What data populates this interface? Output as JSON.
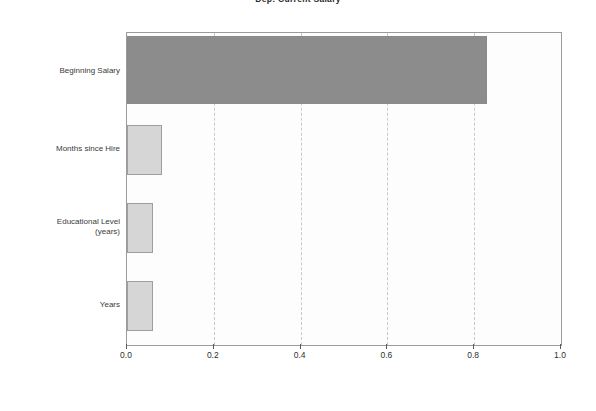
{
  "chart_data": {
    "type": "bar",
    "orientation": "horizontal",
    "title": "Dep: Current Salary",
    "xlabel": "",
    "ylabel": "",
    "categories": [
      "Beginning Salary",
      "Months since Hire",
      "Educational Level\n(years)",
      "Years"
    ],
    "values": [
      0.83,
      0.08,
      0.06,
      0.06
    ],
    "xlim": [
      0.0,
      1.0
    ],
    "xticks": [
      0.0,
      0.2,
      0.4,
      0.6,
      0.8,
      1.0
    ],
    "xtick_labels": [
      "0.0",
      "0.2",
      "0.4",
      "0.6",
      "0.8",
      "1.0"
    ],
    "grid": "vertical-dashed",
    "legend": "none",
    "bar_colors": [
      "#8c8c8c",
      "#d6d6d6",
      "#d6d6d6",
      "#d6d6d6"
    ],
    "plot_background": "#fdfdfd",
    "frame_color": "#9b9b9b"
  }
}
